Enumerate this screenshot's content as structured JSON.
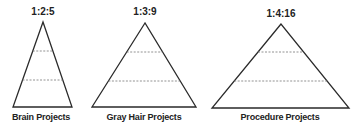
{
  "pyramids": [
    {
      "ratio": "1:2:5",
      "label": "Brain Projects",
      "apex": [
        43,
        22
      ],
      "base_left": [
        13,
        107
      ],
      "base_right": [
        72,
        107
      ],
      "dash_y": [
        51,
        80
      ],
      "ratio_x": 43,
      "ratio_y": 6,
      "label_x": 41,
      "label_y": 112
    },
    {
      "ratio": "1:3:9",
      "label": "Gray Hair  Projects",
      "apex": [
        145,
        23
      ],
      "base_left": [
        92,
        107
      ],
      "base_right": [
        196,
        107
      ],
      "dash_y": [
        52,
        81
      ],
      "ratio_x": 145,
      "ratio_y": 6,
      "label_x": 144,
      "label_y": 112
    },
    {
      "ratio": "1:4:16",
      "label": "Procedure Projects",
      "apex": [
        281,
        24
      ],
      "base_left": [
        212,
        108
      ],
      "base_right": [
        349,
        108
      ],
      "dash_y": [
        52,
        81
      ],
      "ratio_x": 281,
      "ratio_y": 8,
      "label_x": 280,
      "label_y": 112
    }
  ],
  "colors": {
    "line": "#2a2a2a",
    "dash": "#777777",
    "text": "#222222"
  }
}
